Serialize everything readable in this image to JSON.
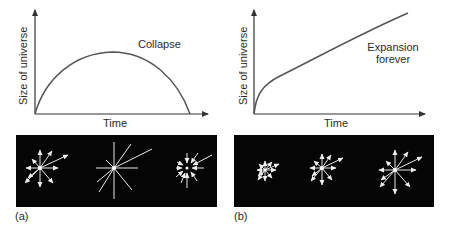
{
  "panels": [
    {
      "id": "a",
      "tag": "(a)",
      "graph": {
        "xlabel": "Time",
        "ylabel": "Size of universe",
        "curve_label": "Collapse",
        "curve_type": "arc rising then falling to zero"
      },
      "starbursts": [
        {
          "stage": "early",
          "arrows": "outward",
          "size": "medium"
        },
        {
          "stage": "max expansion",
          "arrows": "none",
          "size": "large"
        },
        {
          "stage": "collapse",
          "arrows": "inward",
          "size": "small"
        }
      ]
    },
    {
      "id": "b",
      "tag": "(b)",
      "graph": {
        "xlabel": "Time",
        "ylabel": "Size of universe",
        "curve_label_line1": "Expansion",
        "curve_label_line2": "forever",
        "curve_type": "monotonic increasing"
      },
      "starbursts": [
        {
          "stage": "early",
          "arrows": "outward",
          "size": "small"
        },
        {
          "stage": "middle",
          "arrows": "outward",
          "size": "medium"
        },
        {
          "stage": "late",
          "arrows": "outward",
          "size": "large"
        }
      ]
    }
  ],
  "colors": {
    "axis": "#333333",
    "curve": "#555555",
    "panel_bg": "#050505",
    "ray": "#e8e8e8"
  }
}
